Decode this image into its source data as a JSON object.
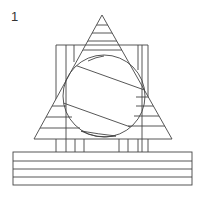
{
  "figure": {
    "label": "1",
    "stroke_color": "#444444",
    "background": "#ffffff"
  }
}
